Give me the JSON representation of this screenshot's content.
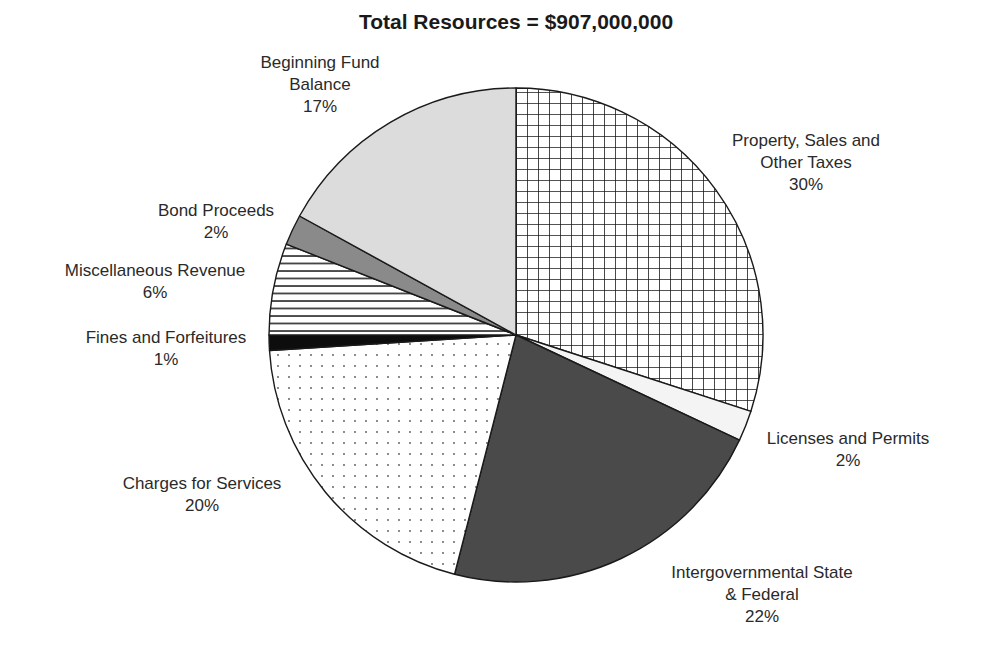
{
  "chart_data": {
    "type": "pie",
    "title": "Total Resources = $907,000,000",
    "total": 907000000,
    "start_angle_deg": 0,
    "direction": "clockwise",
    "slices": [
      {
        "label": "Property, Sales and Other Taxes",
        "lines": [
          "Property, Sales and",
          "Other Taxes"
        ],
        "value": 30,
        "pct_label": "30%",
        "pattern": "grid",
        "color": "#ffffff"
      },
      {
        "label": "Licenses and Permits",
        "lines": [
          "Licenses and Permits"
        ],
        "value": 2,
        "pct_label": "2%",
        "pattern": "solid",
        "color": "#f4f4f4"
      },
      {
        "label": "Intergovernmental State & Federal",
        "lines": [
          "Intergovernmental State",
          "& Federal"
        ],
        "value": 22,
        "pct_label": "22%",
        "pattern": "solid",
        "color": "#4a4a4a"
      },
      {
        "label": "Charges for Services",
        "lines": [
          "Charges for Services"
        ],
        "value": 20,
        "pct_label": "20%",
        "pattern": "dots",
        "color": "#ffffff"
      },
      {
        "label": "Fines and Forfeitures",
        "lines": [
          "Fines and Forfeitures"
        ],
        "value": 1,
        "pct_label": "1%",
        "pattern": "solid",
        "color": "#0d0d0d"
      },
      {
        "label": "Miscellaneous Revenue",
        "lines": [
          "Miscellaneous Revenue"
        ],
        "value": 6,
        "pct_label": "6%",
        "pattern": "hlines",
        "color": "#ffffff"
      },
      {
        "label": "Bond Proceeds",
        "lines": [
          "Bond Proceeds"
        ],
        "value": 2,
        "pct_label": "2%",
        "pattern": "solid",
        "color": "#8a8a8a"
      },
      {
        "label": "Beginning Fund Balance",
        "lines": [
          "Beginning Fund",
          "Balance"
        ],
        "value": 17,
        "pct_label": "17%",
        "pattern": "solid",
        "color": "#dcdcdc"
      }
    ],
    "label_positions": [
      {
        "x": 806,
        "y": 130
      },
      {
        "x": 848,
        "y": 428
      },
      {
        "x": 762,
        "y": 562
      },
      {
        "x": 202,
        "y": 473
      },
      {
        "x": 166,
        "y": 327
      },
      {
        "x": 155,
        "y": 260
      },
      {
        "x": 216,
        "y": 200
      },
      {
        "x": 320,
        "y": 52
      }
    ],
    "legend": "none",
    "grid": false
  }
}
